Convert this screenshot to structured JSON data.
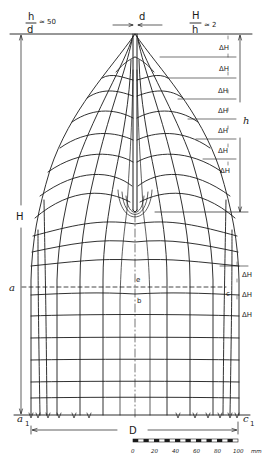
{
  "figure": {
    "type": "flow-net diagram",
    "ratio_top_left": {
      "numerator": "h",
      "denominator": "d",
      "value": "≈ 50"
    },
    "ratio_top_right": {
      "numerator": "H",
      "denominator": "h",
      "value": "≈ 2"
    },
    "dimension_d": "d",
    "dimension_H": "H",
    "dimension_h": "h",
    "dimension_D": "D",
    "delta_label": "ΔH",
    "delta_upper_count": 7,
    "delta_lower_count": 3,
    "points": {
      "a": "a",
      "b": "b",
      "c": "c",
      "e": "e",
      "a1": "a",
      "a1_sub": "1",
      "c1": "c",
      "c1_sub": "1"
    },
    "scale_bar": {
      "labels": [
        "0",
        "20",
        "40",
        "60",
        "80",
        "100"
      ],
      "unit": "mm"
    },
    "colors": {
      "ink": "#1a1a1a",
      "background": "#ffffff"
    }
  }
}
